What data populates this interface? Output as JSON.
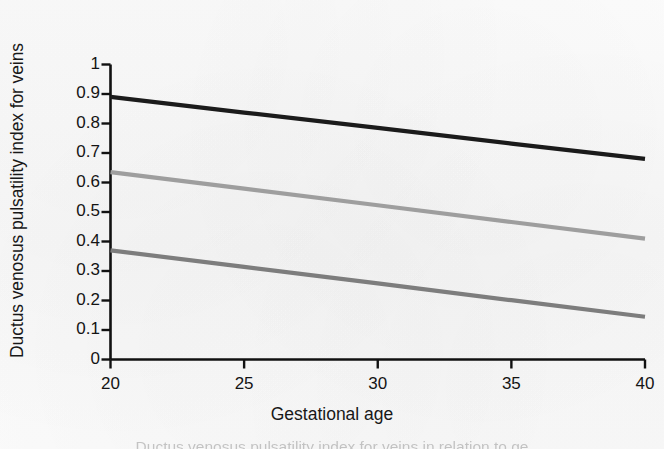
{
  "figure": {
    "background_color": "#fbfbfb",
    "caption_fragment": "Ductus venosus pulsatility index for veins in relation to ge"
  },
  "axes": {
    "x": {
      "title": "Gestational age",
      "ticks": [
        20,
        25,
        30,
        35,
        40
      ],
      "tick_labels": [
        "20",
        "25",
        "30",
        "35",
        "40"
      ],
      "min": 20,
      "max": 40,
      "axis_color": "#111111"
    },
    "y": {
      "title": "Ductus venosus pulsatility index for veins",
      "ticks": [
        0,
        0.1,
        0.2,
        0.3,
        0.4,
        0.5,
        0.6,
        0.7,
        0.8,
        0.9,
        1
      ],
      "tick_labels": [
        "0",
        "0.1",
        "0.2",
        "0.3",
        "0.4",
        "0.5",
        "0.6",
        "0.7",
        "0.8",
        "0.9",
        "1"
      ],
      "min": 0,
      "max": 1,
      "axis_color": "#111111"
    }
  },
  "chart_data": {
    "type": "line",
    "title": "",
    "subtitle": "",
    "xlabel": "Gestational age",
    "ylabel": "Ductus venosus pulsatility index for veins",
    "xlim": [
      20,
      40
    ],
    "ylim": [
      0,
      1
    ],
    "xticks": [
      20,
      25,
      30,
      35,
      40
    ],
    "yticks": [
      0,
      0.1,
      0.2,
      0.3,
      0.4,
      0.5,
      0.6,
      0.7,
      0.8,
      0.9,
      1
    ],
    "grid": false,
    "legend": "none",
    "x": [
      20,
      25,
      30,
      35,
      40
    ],
    "series": [
      {
        "name": "upper reference line",
        "color": "#1b1b1b",
        "width": 4.2,
        "values": [
          0.89,
          0.837,
          0.785,
          0.732,
          0.68
        ]
      },
      {
        "name": "middle reference line",
        "color": "#9e9e9e",
        "width": 4.2,
        "values": [
          0.635,
          0.579,
          0.523,
          0.466,
          0.41
        ]
      },
      {
        "name": "lower reference line",
        "color": "#7d7d7d",
        "width": 4.2,
        "values": [
          0.37,
          0.314,
          0.258,
          0.201,
          0.145
        ]
      }
    ]
  }
}
